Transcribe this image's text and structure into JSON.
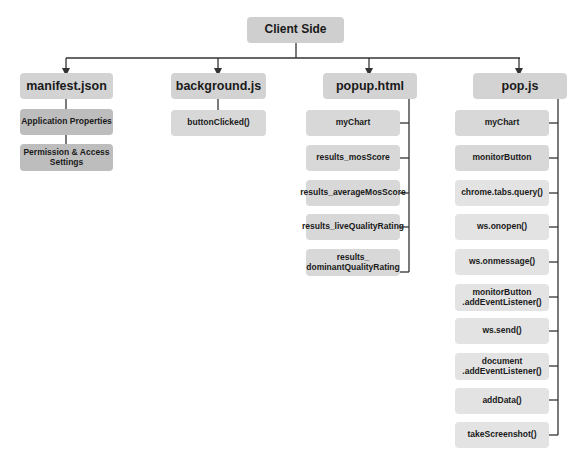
{
  "diagram": {
    "root": {
      "label": "Client Side"
    },
    "columns": [
      {
        "label": "manifest.json",
        "children": [
          "Application Properties",
          "Permission & Access Settings"
        ]
      },
      {
        "label": "background.js",
        "children": [
          "buttonClicked()"
        ]
      },
      {
        "label": "popup.html",
        "children": [
          "myChart",
          "results_mosScore",
          "results_averageMosScore",
          "results_liveQualityRating",
          "results_ dominantQualityRating"
        ]
      },
      {
        "label": "pop.js",
        "children": [
          "myChart",
          "monitorButton",
          "chrome.tabs.query()",
          "ws.onopen()",
          "ws.onmessage()",
          "monitorButton .addEventListener()",
          "ws.send()",
          "document .addEventListener()",
          "addData()",
          "takeScreenshot()"
        ]
      }
    ],
    "colors": {
      "root_fill": "#cfcfcf",
      "header_fill": "#d3d3d3",
      "child_dark_fill": "#bdbdbd",
      "child_fill": "#d8d8d8",
      "child_light_fill": "#e3e3e3",
      "connector": "#333333"
    }
  }
}
